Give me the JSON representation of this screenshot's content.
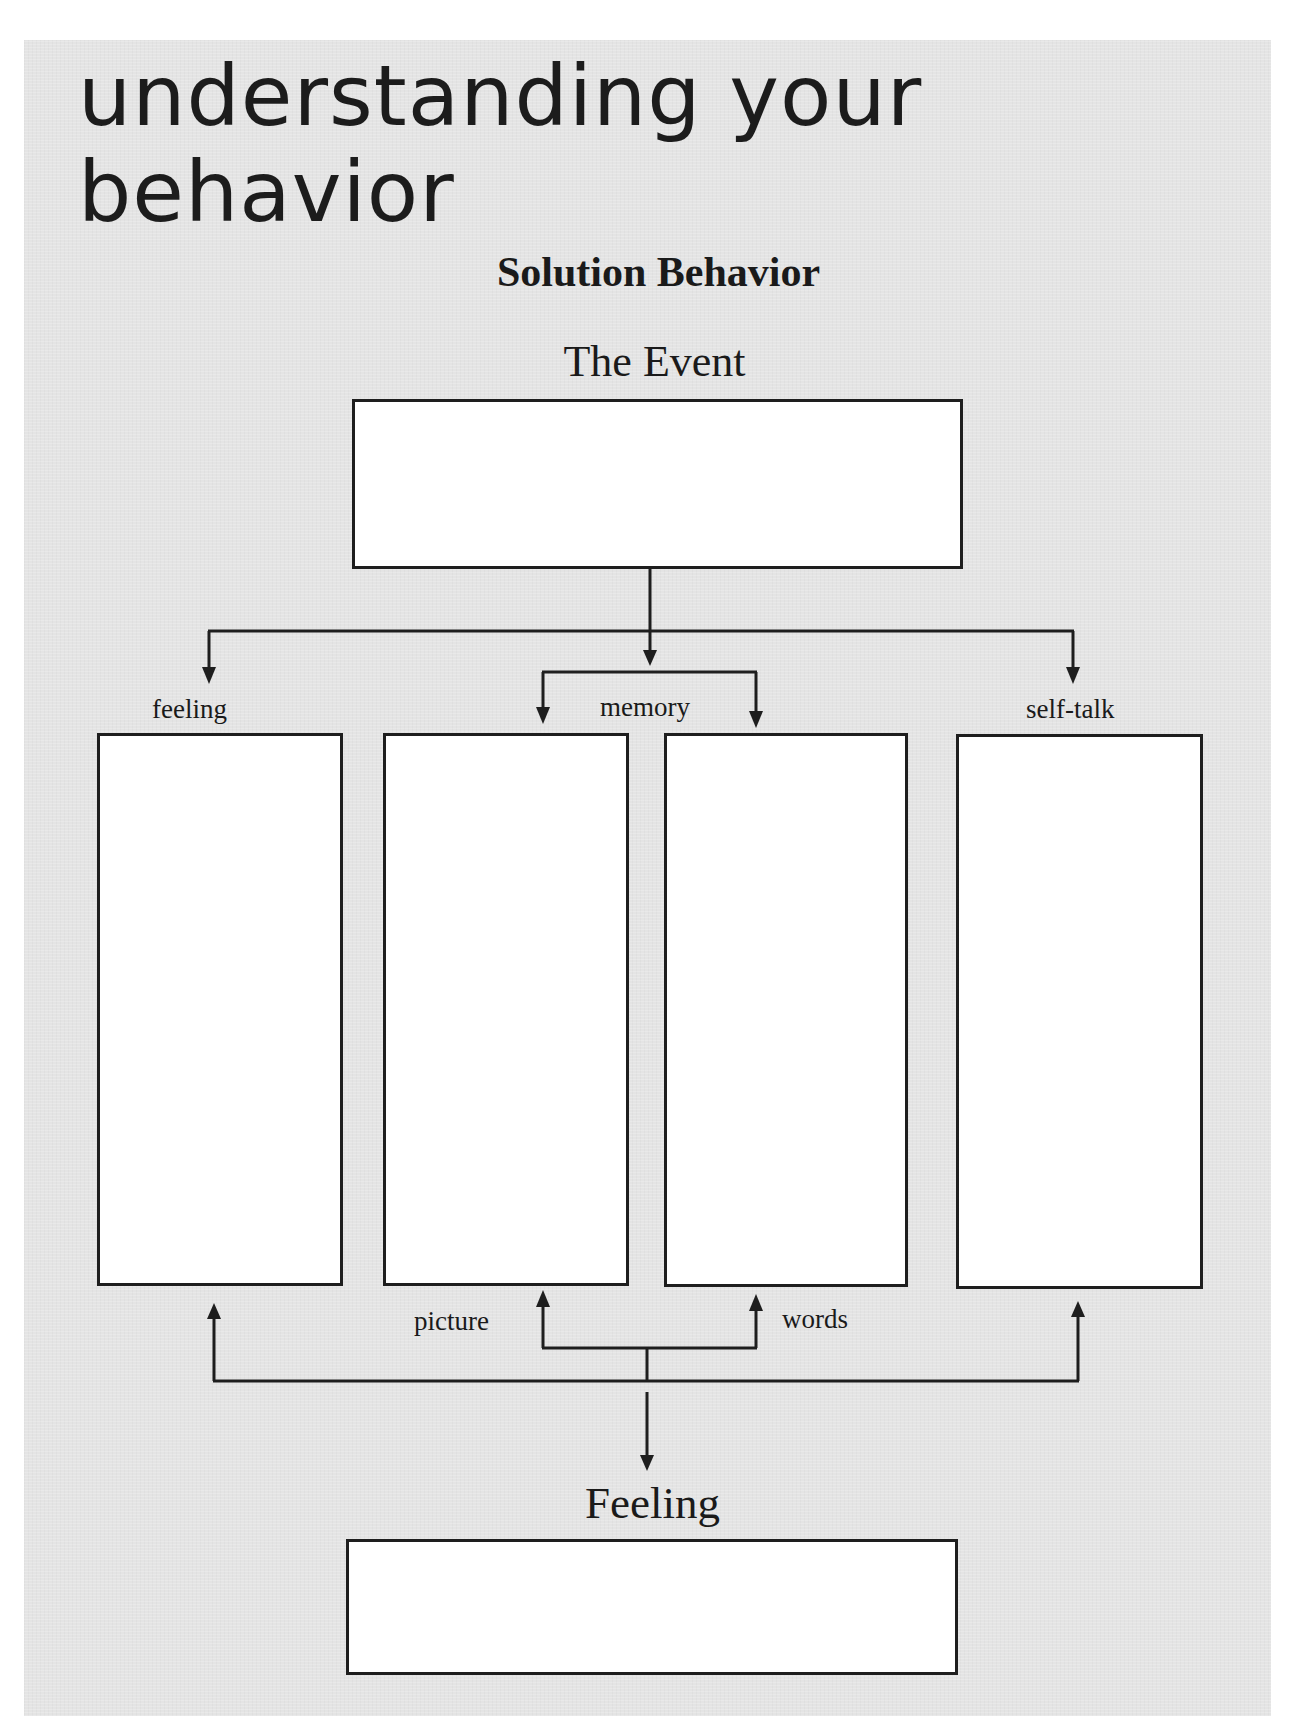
{
  "page": {
    "title_line1": "understanding your",
    "title_line2": "behavior",
    "subtitle": "Solution Behavior",
    "colors": {
      "panel_background": "#e4e4e4",
      "box_fill": "#ffffff",
      "line": "#1e1e1e"
    }
  },
  "diagram": {
    "event": {
      "label": "The Event",
      "value": ""
    },
    "branches": {
      "feeling": {
        "label": "feeling",
        "value": ""
      },
      "memory": {
        "label": "memory"
      },
      "memory_picture": {
        "label": "picture",
        "value": ""
      },
      "memory_words": {
        "label": "words",
        "value": ""
      },
      "self_talk": {
        "label": "self-talk",
        "value": ""
      }
    },
    "result": {
      "label": "Feeling",
      "value": ""
    }
  }
}
